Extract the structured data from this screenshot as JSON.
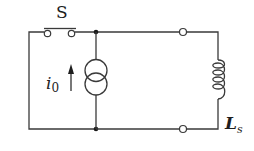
{
  "diagram": {
    "type": "circuit",
    "components": [
      {
        "id": "switch",
        "kind": "switch",
        "label": "S",
        "state": "open"
      },
      {
        "id": "current-source",
        "kind": "current-source",
        "label_main": "i",
        "label_sub": "0",
        "direction": "up"
      },
      {
        "id": "inductor",
        "kind": "inductor",
        "label_main": "L",
        "label_sub": "s"
      }
    ],
    "nodes": [
      {
        "id": "junction-top",
        "kind": "junction-dot"
      },
      {
        "id": "junction-bottom",
        "kind": "junction-dot"
      },
      {
        "id": "terminal-top",
        "kind": "open-terminal"
      },
      {
        "id": "terminal-bottom",
        "kind": "open-terminal"
      }
    ],
    "colors": {
      "wire": "#3a3a3a",
      "text": "#1e1e1e",
      "background": "#ffffff"
    }
  }
}
